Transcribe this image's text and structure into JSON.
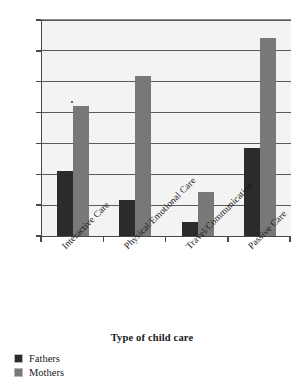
{
  "chart_data": {
    "type": "bar",
    "title": "",
    "xlabel": "Type of child care",
    "ylabel": "",
    "ylim": [
      0,
      3.5
    ],
    "yticks": [
      "0",
      "0.5",
      "1",
      "1.5",
      "2",
      "2.5",
      "3",
      "3.5"
    ],
    "ytick_values": [
      0,
      0.5,
      1,
      1.5,
      2,
      2.5,
      3,
      3.5
    ],
    "grid": true,
    "legend_position": "below-left",
    "categories": [
      "Interactive Care",
      "Physical/Emotional Care",
      "Travel/Communication",
      "Passive Care"
    ],
    "series": [
      {
        "name": "Fathers",
        "color": "#2b2b2b",
        "values": [
          1.06,
          0.58,
          0.22,
          1.42
        ]
      },
      {
        "name": "Mothers",
        "color": "#787878",
        "values": [
          2.11,
          2.59,
          0.71,
          3.21
        ]
      }
    ]
  }
}
